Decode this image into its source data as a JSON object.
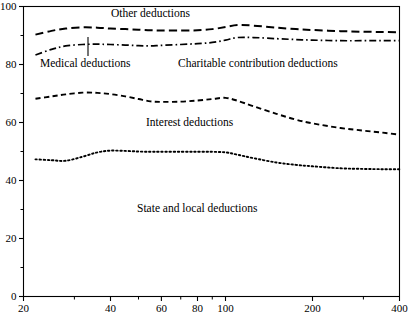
{
  "chart_data": {
    "type": "line",
    "title": "",
    "subtitle": "",
    "xlabel": "",
    "ylabel": "",
    "xscale": "log",
    "yscale": "linear",
    "xlim": [
      20,
      400
    ],
    "ylim": [
      0,
      100
    ],
    "grid": false,
    "legend": "inline-annotations",
    "x_ticks_major": [
      20,
      40,
      60,
      80,
      100,
      200,
      400
    ],
    "x_tick_labels": [
      "20",
      "40",
      "60",
      "80",
      "100",
      "200",
      "400"
    ],
    "x_ticks_minor": [
      30,
      50,
      70,
      90,
      300
    ],
    "y_ticks_major": [
      0,
      20,
      40,
      60,
      80,
      100
    ],
    "y_tick_labels": [
      "0",
      "20",
      "40",
      "60",
      "80",
      "100"
    ],
    "y_ticks_minor": [
      10,
      30,
      50,
      70,
      90
    ],
    "x": [
      22,
      25,
      28,
      32,
      36,
      40,
      45,
      50,
      55,
      60,
      70,
      80,
      90,
      100,
      110,
      125,
      150,
      175,
      200,
      250,
      300,
      350,
      400
    ],
    "series": [
      {
        "name": "Other deductions",
        "dash": "long-dash",
        "values": [
          90.3,
          91.6,
          92.4,
          92.8,
          92.7,
          92.4,
          92.2,
          92.0,
          91.8,
          91.7,
          91.7,
          91.8,
          92.2,
          92.9,
          93.6,
          93.4,
          92.7,
          92.2,
          91.9,
          91.5,
          91.3,
          91.2,
          91.1
        ]
      },
      {
        "name": "Charitable contribution deductions",
        "dash": "dash-dot",
        "values": [
          83.3,
          85.2,
          86.4,
          86.9,
          87.0,
          86.9,
          86.7,
          86.5,
          86.4,
          86.6,
          86.9,
          87.2,
          87.6,
          88.4,
          89.3,
          89.3,
          88.9,
          88.6,
          88.4,
          88.2,
          88.2,
          88.2,
          88.2
        ]
      },
      {
        "name": "Interest deductions",
        "dash": "medium-dash",
        "values": [
          68.2,
          69.0,
          69.7,
          70.3,
          70.2,
          69.8,
          69.0,
          68.1,
          67.3,
          67.1,
          67.2,
          67.6,
          68.1,
          68.5,
          67.5,
          65.6,
          63.0,
          61.0,
          59.7,
          58.1,
          57.2,
          56.5,
          55.8
        ]
      },
      {
        "name": "State and local deductions",
        "dash": "dotted",
        "values": [
          47.3,
          47.0,
          46.8,
          48.2,
          49.7,
          50.3,
          50.2,
          50.0,
          49.9,
          49.9,
          49.9,
          49.9,
          49.9,
          49.7,
          48.9,
          47.7,
          46.2,
          45.4,
          44.9,
          44.2,
          44.0,
          43.9,
          43.9
        ]
      }
    ],
    "annotations": [
      {
        "name": "other-deductions-label",
        "text": "Other deductions",
        "x_px": 111,
        "y_px": 8,
        "pointer": false
      },
      {
        "name": "medical-deductions-label",
        "text": "Medical deductions",
        "x_px": 40,
        "y_px": 58,
        "pointer": true,
        "pointer_x_px": 88,
        "pointer_y0_px": 56,
        "pointer_y1_px": 37
      },
      {
        "name": "charitable-contribution-deductions-label",
        "text": "Charitable contribution deductions",
        "x_px": 178,
        "y_px": 58,
        "pointer": false
      },
      {
        "name": "interest-deductions-label",
        "text": "Interest deductions",
        "x_px": 146,
        "y_px": 117,
        "pointer": false
      },
      {
        "name": "state-and-local-deductions-label",
        "text": "State and local deductions",
        "x_px": 137,
        "y_px": 203,
        "pointer": false
      }
    ],
    "colors": {
      "axis": "#000000",
      "line": "#000000",
      "background": "#ffffff",
      "text": "#000000"
    }
  }
}
